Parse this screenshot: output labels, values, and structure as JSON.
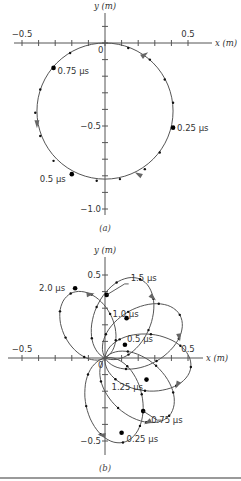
{
  "figure": {
    "panels": [
      "(a)",
      "(b)"
    ],
    "bottom_rule_color": "#9a9a9a"
  },
  "chart_data": [
    {
      "type": "line",
      "panel": "(a)",
      "title": "",
      "xlabel": "x (m)",
      "ylabel": "y (m)",
      "origin_label": "0",
      "xlim": [
        -0.5,
        0.5
      ],
      "ylim": [
        -1.0,
        0.1
      ],
      "x_tick_labels": [
        {
          "v": -0.5,
          "t": "−0.5"
        },
        {
          "v": 0.5,
          "t": "0.5"
        }
      ],
      "y_tick_labels": [
        {
          "v": -0.5,
          "t": "−0.5"
        },
        {
          "v": -1.0,
          "t": "−1.0"
        }
      ],
      "tick_step": 0.1,
      "grid": false,
      "trajectory": {
        "shape": "circle",
        "center": [
          0.0,
          -0.41
        ],
        "radius": 0.41,
        "direction": "clockwise"
      },
      "time_markers": [
        {
          "label": "0.25 μs",
          "x": 0.41,
          "y": -0.51
        },
        {
          "label": "0.5 μs",
          "x": -0.2,
          "y": -0.79
        },
        {
          "label": "0.75 μs",
          "x": -0.31,
          "y": -0.15
        }
      ],
      "small_dots": [
        [
          0.14,
          -0.03
        ],
        [
          0.27,
          -0.1
        ],
        [
          0.36,
          -0.22
        ],
        [
          0.41,
          -0.36
        ],
        [
          0.33,
          -0.66
        ],
        [
          0.24,
          -0.76
        ],
        [
          0.09,
          -0.82
        ],
        [
          -0.05,
          -0.83
        ],
        [
          -0.31,
          -0.71
        ],
        [
          -0.39,
          -0.56
        ],
        [
          -0.42,
          -0.42
        ],
        [
          -0.39,
          -0.28
        ],
        [
          -0.21,
          -0.06
        ]
      ],
      "arrows": [
        {
          "x": 0.24,
          "y": -0.07,
          "angle": 35
        },
        {
          "x": 0.2,
          "y": -0.79,
          "angle": 150
        },
        {
          "x": -0.41,
          "y": -0.49,
          "angle": -90
        }
      ]
    },
    {
      "type": "line",
      "panel": "(b)",
      "title": "",
      "xlabel": "x (m)",
      "ylabel": "y (m)",
      "origin_label": "0",
      "xlim": [
        -0.5,
        0.5
      ],
      "ylim": [
        -0.5,
        0.5
      ],
      "x_tick_labels": [
        {
          "v": -0.5,
          "t": "−0.5"
        },
        {
          "v": 0.5,
          "t": "0.5"
        }
      ],
      "y_tick_labels": [
        {
          "v": 0.5,
          "t": "0.5"
        },
        {
          "v": -0.5,
          "t": "−0.5"
        }
      ],
      "tick_step": 0.1,
      "grid": false,
      "trajectory": {
        "shape": "petals",
        "petals": [
          {
            "name": "bottom",
            "angle_deg": -78,
            "length": 0.52,
            "width": 0.36
          },
          {
            "name": "lower-right",
            "angle_deg": -42,
            "length": 0.52,
            "width": 0.36
          },
          {
            "name": "right",
            "angle_deg": -6,
            "length": 0.52,
            "width": 0.36
          },
          {
            "name": "upper-right",
            "angle_deg": 30,
            "length": 0.52,
            "width": 0.36
          },
          {
            "name": "up",
            "angle_deg": 66,
            "length": 0.52,
            "width": 0.36
          },
          {
            "name": "upper-left",
            "angle_deg": 118,
            "length": 0.44,
            "width": 0.32
          }
        ]
      },
      "time_markers": [
        {
          "label": "0.25 μs",
          "x": 0.1,
          "y": -0.45
        },
        {
          "label": "0.5 μs",
          "x": 0.12,
          "y": 0.08
        },
        {
          "label": "0.75 μs",
          "x": 0.23,
          "y": -0.32
        },
        {
          "label": "1.0 μs",
          "x": 0.13,
          "y": 0.24
        },
        {
          "label": "1.25 μs",
          "x": 0.25,
          "y": -0.13
        },
        {
          "label": "1.5 μs",
          "x": 0.01,
          "y": 0.38
        },
        {
          "label": "2.0 μs",
          "x": -0.18,
          "y": 0.42
        }
      ]
    }
  ]
}
